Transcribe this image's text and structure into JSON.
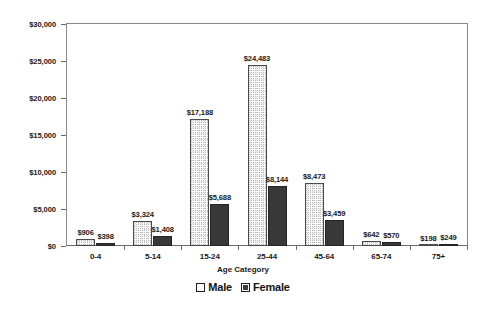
{
  "chart_data": {
    "type": "bar",
    "title": "",
    "xlabel": "Age Category",
    "ylabel": "",
    "ylim": [
      0,
      30000
    ],
    "ytick_values": [
      0,
      5000,
      10000,
      15000,
      20000,
      25000,
      30000
    ],
    "ytick_labels": [
      "$0",
      "$5,000",
      "$10,000",
      "$15,000",
      "$20,000",
      "$25,000",
      "$30,000"
    ],
    "categories": [
      "0-4",
      "5-14",
      "15-24",
      "25-44",
      "45-64",
      "65-74",
      "75+"
    ],
    "grid": false,
    "legend_position": "bottom",
    "series": [
      {
        "name": "Male",
        "values": [
          906,
          3324,
          17188,
          24483,
          8473,
          642,
          198
        ],
        "labels": [
          "$906",
          "$3,324",
          "$17,188",
          "$24,483",
          "$8,473",
          "$642",
          "$198"
        ],
        "color": "#fbfbfb"
      },
      {
        "name": "Female",
        "values": [
          398,
          1408,
          5688,
          8144,
          3459,
          570,
          249
        ],
        "labels": [
          "$398",
          "$1,408",
          "$5,688",
          "$8,144",
          "$3,459",
          "$570",
          "$249"
        ],
        "color": "#383838"
      }
    ]
  },
  "legend": {
    "items": [
      {
        "label": "Male",
        "swatch": "hollow-square"
      },
      {
        "label": "Female",
        "swatch": "filled-square"
      }
    ]
  },
  "axis": {
    "x_title": "Age Category"
  }
}
